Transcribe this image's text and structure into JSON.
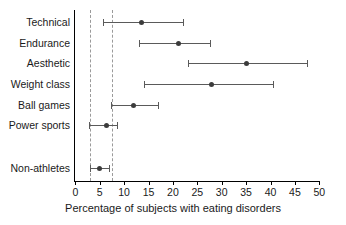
{
  "chart_data": {
    "type": "scatter",
    "title": "",
    "xlabel": "Percentage of subjects with eating disorders",
    "ylabel": "",
    "xlim": [
      0,
      50
    ],
    "xticks": [
      0,
      5,
      10,
      15,
      20,
      25,
      30,
      35,
      40,
      45,
      50
    ],
    "xtick_labels": [
      "0",
      "5",
      "10",
      "15",
      "20",
      "25",
      "30",
      "35",
      "40",
      "45",
      "50"
    ],
    "grid": false,
    "legend": null,
    "orientation": "horizontal",
    "marker": "filled-circle",
    "errorbar_style": "horizontal-line-with-end-caps",
    "reference_lines": [
      {
        "value": 3.0,
        "style": "dashed",
        "color": "#9a9a9a"
      },
      {
        "value": 7.5,
        "style": "dashed",
        "color": "#9a9a9a"
      }
    ],
    "categories": [
      "Technical",
      "Endurance",
      "Aesthetic",
      "Weight class",
      "Ball games",
      "Power sports",
      "Non-athletes"
    ],
    "values": [
      13.6,
      21.2,
      35.0,
      28.0,
      11.9,
      6.4,
      5.0
    ],
    "ci_low": [
      5.7,
      13.1,
      23.0,
      14.0,
      7.3,
      2.9,
      3.1
    ],
    "ci_high": [
      22.0,
      27.6,
      47.4,
      40.6,
      16.9,
      8.5,
      7.0
    ],
    "points": [
      {
        "category": "Technical",
        "value": 13.6,
        "low": 5.7,
        "high": 22.0
      },
      {
        "category": "Endurance",
        "value": 21.2,
        "low": 13.1,
        "high": 27.6
      },
      {
        "category": "Aesthetic",
        "value": 35.0,
        "low": 23.0,
        "high": 47.4
      },
      {
        "category": "Weight class",
        "value": 28.0,
        "low": 14.0,
        "high": 40.6
      },
      {
        "category": "Ball games",
        "value": 11.9,
        "low": 7.3,
        "high": 16.9
      },
      {
        "category": "Power sports",
        "value": 6.4,
        "low": 2.9,
        "high": 8.5
      },
      {
        "category": "Non-athletes",
        "value": 5.0,
        "low": 3.1,
        "high": 7.0
      }
    ],
    "colors": {
      "marker": "#3b3b3b",
      "errorbar": "#5a5a5a",
      "axis": "#000000",
      "reference_line": "#9a9a9a",
      "text": "#1a1a1a",
      "background": "#ffffff"
    }
  }
}
